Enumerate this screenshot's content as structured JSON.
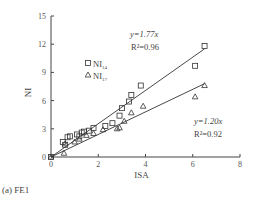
{
  "chart_data": {
    "type": "scatter",
    "title": "",
    "caption": "(a) FE1",
    "xlabel": "ISA",
    "ylabel": "NI",
    "xlim": [
      0,
      8
    ],
    "ylim": [
      0,
      15
    ],
    "xticks": [
      0,
      2,
      4,
      6,
      8
    ],
    "yticks": [
      0,
      3,
      6,
      9,
      12,
      15
    ],
    "grid": false,
    "legend_position": "upper-left-inside",
    "series": [
      {
        "name": "NI_14",
        "legend_main": "NI",
        "legend_sub": "14",
        "marker": "square",
        "points": [
          [
            0,
            0
          ],
          [
            0.5,
            1.6
          ],
          [
            0.6,
            1.3
          ],
          [
            0.7,
            2.1
          ],
          [
            0.8,
            2.2
          ],
          [
            1.1,
            2.4
          ],
          [
            1.2,
            2.2
          ],
          [
            1.3,
            2.6
          ],
          [
            1.4,
            2.7
          ],
          [
            1.6,
            2.8
          ],
          [
            1.8,
            3.1
          ],
          [
            2.3,
            3.3
          ],
          [
            2.6,
            3.6
          ],
          [
            2.9,
            4.4
          ],
          [
            3.0,
            5.2
          ],
          [
            3.3,
            5.9
          ],
          [
            3.4,
            6.6
          ],
          [
            3.8,
            7.6
          ],
          [
            6.1,
            9.7
          ],
          [
            6.5,
            11.8
          ]
        ],
        "fit": {
          "equation": "y=1.77x",
          "r2_label": "R²=0.96",
          "slope": 1.77,
          "r2": 0.96,
          "x_range": [
            0,
            6.5
          ]
        }
      },
      {
        "name": "NI_17",
        "legend_main": "NI",
        "legend_sub": "17",
        "marker": "triangle",
        "points": [
          [
            0,
            0
          ],
          [
            0.55,
            0.4
          ],
          [
            0.6,
            1.4
          ],
          [
            1.0,
            1.6
          ],
          [
            1.2,
            1.9
          ],
          [
            1.5,
            2.3
          ],
          [
            1.8,
            2.5
          ],
          [
            2.2,
            2.9
          ],
          [
            2.8,
            3.0
          ],
          [
            2.9,
            3.1
          ],
          [
            3.1,
            3.8
          ],
          [
            3.4,
            4.7
          ],
          [
            3.9,
            5.4
          ],
          [
            6.1,
            6.4
          ],
          [
            6.5,
            7.6
          ]
        ],
        "fit": {
          "equation": "y=1.20x",
          "r2_label": "R²=0.92",
          "slope": 1.2,
          "r2": 0.92,
          "x_range": [
            0,
            6.5
          ]
        }
      }
    ]
  }
}
